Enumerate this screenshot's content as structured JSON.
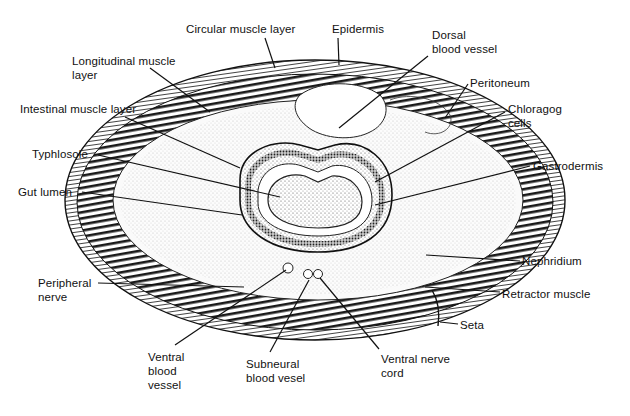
{
  "diagram": {
    "labels": [
      {
        "id": "circular-muscle-layer",
        "text": "Circular muscle layer",
        "x": 186,
        "y": 22,
        "line": [
          [
            265,
            38
          ],
          [
            275,
            68
          ]
        ]
      },
      {
        "id": "epidermis",
        "text": "Epidermis",
        "x": 332,
        "y": 22,
        "line": [
          [
            338,
            38
          ],
          [
            339,
            65
          ]
        ]
      },
      {
        "id": "dorsal-blood-vessel",
        "text": "Dorsal\nblood vessel",
        "x": 432,
        "y": 28,
        "line": [
          [
            428,
            56
          ],
          [
            339,
            128
          ]
        ]
      },
      {
        "id": "longitudinal-muscle-layer",
        "text": "Longitudinal muscle\nlayer",
        "x": 72,
        "y": 54,
        "line": [
          [
            150,
            68
          ],
          [
            210,
            112
          ]
        ]
      },
      {
        "id": "peritoneum",
        "text": "Peritoneum",
        "x": 470,
        "y": 76,
        "line": [
          [
            468,
            84
          ],
          [
            445,
            118
          ]
        ]
      },
      {
        "id": "chloragog-cells",
        "text": "Chloragog\ncells",
        "x": 508,
        "y": 102,
        "line": [
          [
            505,
            112
          ],
          [
            375,
            182
          ]
        ]
      },
      {
        "id": "intestinal-muscle-layer",
        "text": "Intestinal muscle layer",
        "x": 20,
        "y": 102,
        "line": [
          [
            125,
            117
          ],
          [
            240,
            168
          ]
        ]
      },
      {
        "id": "typhlosole",
        "text": "Typhlosole",
        "x": 32,
        "y": 147,
        "line": [
          [
            98,
            155
          ],
          [
            280,
            197
          ]
        ]
      },
      {
        "id": "gastrodermis",
        "text": "Gastrodermis",
        "x": 533,
        "y": 159,
        "line": [
          [
            530,
            166
          ],
          [
            375,
            205
          ]
        ]
      },
      {
        "id": "gut-lumen",
        "text": "Gut lumen",
        "x": 18,
        "y": 185,
        "line": [
          [
            82,
            192
          ],
          [
            242,
            215
          ]
        ]
      },
      {
        "id": "nephridium",
        "text": "Nephridium",
        "x": 522,
        "y": 254,
        "line": [
          [
            520,
            261
          ],
          [
            426,
            255
          ]
        ]
      },
      {
        "id": "peripheral-nerve",
        "text": "Peripheral\nnerve",
        "x": 38,
        "y": 276,
        "line": [
          [
            98,
            283
          ],
          [
            244,
            287
          ]
        ]
      },
      {
        "id": "retractor-muscle",
        "text": "Retractor muscle",
        "x": 502,
        "y": 287,
        "line": [
          [
            500,
            292
          ],
          [
            425,
            287
          ]
        ]
      },
      {
        "id": "seta",
        "text": "Seta",
        "x": 460,
        "y": 318,
        "line": [
          [
            458,
            324
          ],
          [
            440,
            322
          ]
        ]
      },
      {
        "id": "ventral-blood-vessel",
        "text": "Ventral\nblood\nvessel",
        "x": 148,
        "y": 350,
        "line": [
          [
            175,
            345
          ],
          [
            286,
            270
          ]
        ]
      },
      {
        "id": "subneural-blood-vesel",
        "text": "Subneural\nblood vesel",
        "x": 246,
        "y": 357,
        "line": [
          [
            270,
            352
          ],
          [
            309,
            280
          ]
        ]
      },
      {
        "id": "ventral-nerve-cord",
        "text": "Ventral nerve\ncord",
        "x": 381,
        "y": 352,
        "line": [
          [
            379,
            349
          ],
          [
            320,
            278
          ]
        ]
      }
    ]
  }
}
